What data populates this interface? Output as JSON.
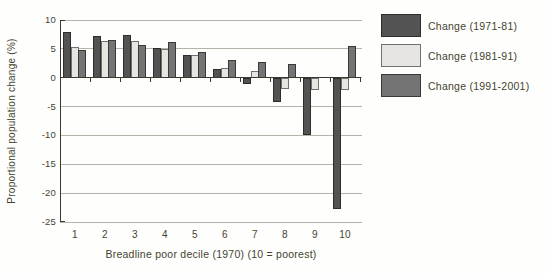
{
  "chart_data": {
    "type": "bar",
    "title": "",
    "xlabel": "Breadline poor decile (1970) (10 = poorest)",
    "ylabel": "Proportional population change (%)",
    "categories": [
      "1",
      "2",
      "3",
      "4",
      "5",
      "6",
      "7",
      "8",
      "9",
      "10"
    ],
    "series": [
      {
        "name": "Change (1971-81)",
        "color": "#535353",
        "border": "#2d2d2d",
        "values": [
          7.9,
          7.2,
          7.4,
          5.1,
          4.0,
          1.5,
          -1.1,
          -4.2,
          -10.0,
          -22.8
        ]
      },
      {
        "name": "Change (1981-91)",
        "color": "#e6e5e1",
        "border": "#72716c",
        "values": [
          5.3,
          6.3,
          6.4,
          5.0,
          3.9,
          1.7,
          1.1,
          -2.0,
          -2.2,
          -2.1
        ]
      },
      {
        "name": "Change (1991-2001)",
        "color": "#747474",
        "border": "#3a3a3a",
        "values": [
          4.8,
          6.6,
          5.6,
          6.2,
          4.4,
          3.0,
          2.7,
          2.4,
          0,
          5.5
        ]
      }
    ],
    "ylim": [
      -25,
      10
    ],
    "yticks": [
      10,
      5,
      0,
      -5,
      -10,
      -15,
      -20,
      -25
    ],
    "grid": true,
    "legend_position": "right"
  },
  "colors": {
    "background": "#fefefd",
    "gridline": "#b5b4ab",
    "axis": "#3b392e",
    "text": "#45432f"
  }
}
